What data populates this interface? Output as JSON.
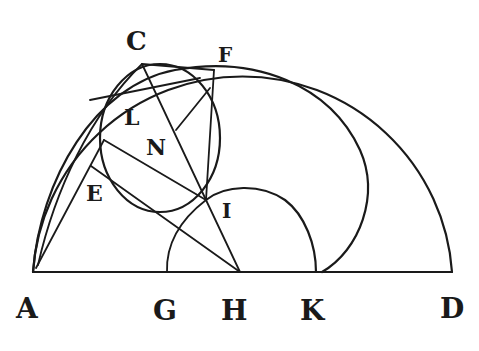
{
  "figure": {
    "type": "geometric-diagram",
    "ink_color": "#1a1a1a",
    "background": "#ffffff",
    "labels": {
      "C": "C",
      "F": "F",
      "L": "L",
      "N": "N",
      "E": "E",
      "I": "I",
      "A": "A",
      "G": "G",
      "H": "H",
      "K": "K",
      "D": "D"
    },
    "points": {
      "A": [
        33,
        272
      ],
      "G": [
        167,
        272
      ],
      "H": [
        240,
        272
      ],
      "K": [
        316,
        272
      ],
      "D": [
        452,
        272
      ],
      "C": [
        142,
        64
      ],
      "F": [
        214,
        70
      ],
      "I": [
        206,
        200
      ],
      "P": [
        104,
        140
      ],
      "Q": [
        100,
        165
      ],
      "N_pt": [
        176,
        130
      ]
    }
  }
}
